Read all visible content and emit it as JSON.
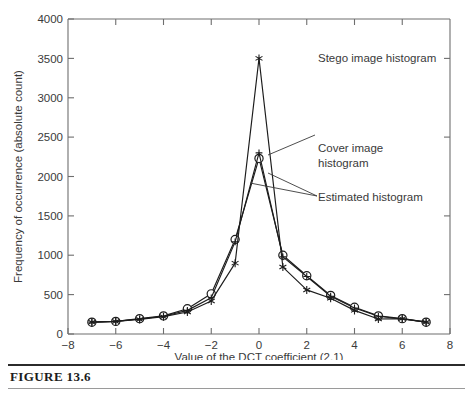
{
  "figure": {
    "caption": "FIGURE 13.6"
  },
  "chart_data": {
    "type": "line",
    "title": "",
    "xlabel": "Value of the DCT coefficient (2,1)",
    "ylabel": "Frequency of occurrence (absolute count)",
    "xlim": [
      -8,
      8
    ],
    "ylim": [
      0,
      4000
    ],
    "xticks": [
      -8,
      -6,
      -4,
      -2,
      0,
      2,
      4,
      6,
      8
    ],
    "xticklabels": [
      "−8",
      "−6",
      "−4",
      "−2",
      "0",
      "2",
      "4",
      "6",
      "8"
    ],
    "yticks": [
      0,
      500,
      1000,
      1500,
      2000,
      2500,
      3000,
      3500,
      4000
    ],
    "yticklabels": [
      "0",
      "500",
      "1000",
      "1500",
      "2000",
      "2500",
      "3000",
      "3500",
      "4000"
    ],
    "grid": false,
    "legend": "annotations",
    "x": [
      -7,
      -6,
      -5,
      -4,
      -3,
      -2,
      -1,
      0,
      1,
      2,
      3,
      4,
      5,
      6,
      7
    ],
    "series": [
      {
        "name": "Cover image histogram",
        "marker": "circle",
        "values": [
          150,
          160,
          195,
          230,
          320,
          510,
          1200,
          2230,
          1000,
          740,
          490,
          340,
          230,
          195,
          150
        ]
      },
      {
        "name": "Estimated histogram",
        "marker": "plus",
        "values": [
          150,
          160,
          190,
          225,
          300,
          460,
          1170,
          2300,
          980,
          730,
          480,
          330,
          225,
          190,
          150
        ]
      },
      {
        "name": "Stego image histogram",
        "marker": "star",
        "values": [
          150,
          160,
          185,
          220,
          280,
          420,
          900,
          3500,
          850,
          560,
          455,
          300,
          190,
          195,
          150
        ]
      }
    ],
    "annotations": [
      {
        "label": "Stego image histogram",
        "target_x": 0,
        "target_y": 3500
      },
      {
        "label_line1": "Cover image",
        "label_line2": "histogram",
        "target_x": 0,
        "target_y": 2230
      },
      {
        "label": "Estimated histogram",
        "target_x": -1,
        "target_y": 1170
      }
    ]
  }
}
